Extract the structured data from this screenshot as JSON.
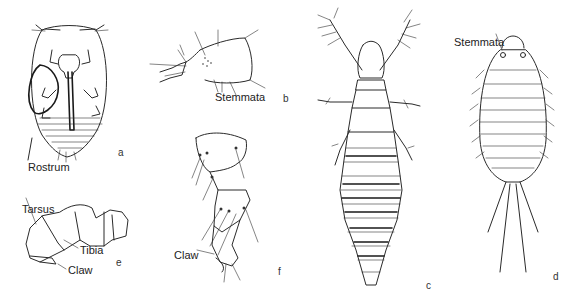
{
  "figure": {
    "panels": [
      {
        "id": "a",
        "letter": "a",
        "subject": "ventral view of larva with rostrum",
        "labels": [
          "Rostrum"
        ]
      },
      {
        "id": "b",
        "letter": "b",
        "subject": "lateral view of head",
        "labels": [
          "Stemmata"
        ]
      },
      {
        "id": "c",
        "letter": "c",
        "subject": "dorsal view of elongate larva",
        "labels": []
      },
      {
        "id": "d",
        "letter": "d",
        "subject": "dorsal view of larva with caudal filaments",
        "labels": [
          "Stemmata"
        ]
      },
      {
        "id": "e",
        "letter": "e",
        "subject": "leg segments",
        "labels": [
          "Tarsus",
          "Tibia",
          "Claw"
        ]
      },
      {
        "id": "f",
        "letter": "f",
        "subject": "leg with setae",
        "labels": [
          "Claw"
        ]
      }
    ]
  },
  "labels": {
    "rostrum": "Rostrum",
    "stemmata_b": "Stemmata",
    "stemmata_d": "Stemmata",
    "tarsus": "Tarsus",
    "tibia": "Tibia",
    "claw_e": "Claw",
    "claw_f": "Claw"
  },
  "letters": {
    "a": "a",
    "b": "b",
    "c": "c",
    "d": "d",
    "e": "e",
    "f": "f"
  }
}
